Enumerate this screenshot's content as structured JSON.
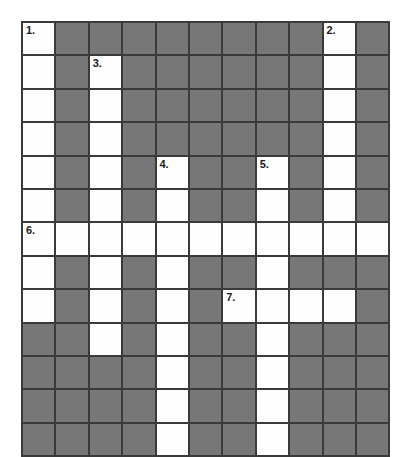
{
  "puzzle": {
    "type": "crossword-grid",
    "rows": 13,
    "cols": 11,
    "cell_size_px": 33.4,
    "colors": {
      "open_cell": "#fdfdfd",
      "block_cell": "#777777",
      "grid_line": "#3a3a3a",
      "number_text": "#1a1a1a",
      "page_background": "#ffffff"
    },
    "legend": {
      "open": "white answer square",
      "block": "shaded blocked square"
    },
    "clue_numbers": [
      {
        "label": "1.",
        "row": 0,
        "col": 0
      },
      {
        "label": "2.",
        "row": 0,
        "col": 9
      },
      {
        "label": "3.",
        "row": 1,
        "col": 2
      },
      {
        "label": "4.",
        "row": 4,
        "col": 4
      },
      {
        "label": "5.",
        "row": 4,
        "col": 7
      },
      {
        "label": "6.",
        "row": 6,
        "col": 0
      },
      {
        "label": "7.",
        "row": 8,
        "col": 6
      }
    ],
    "cells": [
      [
        "open",
        "block",
        "block",
        "block",
        "block",
        "block",
        "block",
        "block",
        "block",
        "open",
        "block"
      ],
      [
        "open",
        "block",
        "open",
        "block",
        "block",
        "block",
        "block",
        "block",
        "block",
        "open",
        "block"
      ],
      [
        "open",
        "block",
        "open",
        "block",
        "block",
        "block",
        "block",
        "block",
        "block",
        "open",
        "block"
      ],
      [
        "open",
        "block",
        "open",
        "block",
        "block",
        "block",
        "block",
        "block",
        "block",
        "open",
        "block"
      ],
      [
        "open",
        "block",
        "open",
        "block",
        "open",
        "block",
        "block",
        "open",
        "block",
        "open",
        "block"
      ],
      [
        "open",
        "block",
        "open",
        "block",
        "open",
        "block",
        "block",
        "open",
        "block",
        "open",
        "block"
      ],
      [
        "open",
        "open",
        "open",
        "open",
        "open",
        "open",
        "open",
        "open",
        "open",
        "open",
        "open"
      ],
      [
        "open",
        "block",
        "open",
        "block",
        "open",
        "block",
        "block",
        "open",
        "block",
        "block",
        "block"
      ],
      [
        "open",
        "block",
        "open",
        "block",
        "open",
        "block",
        "open",
        "open",
        "open",
        "open",
        "block"
      ],
      [
        "block",
        "block",
        "open",
        "block",
        "open",
        "block",
        "block",
        "open",
        "block",
        "block",
        "block"
      ],
      [
        "block",
        "block",
        "block",
        "block",
        "open",
        "block",
        "block",
        "open",
        "block",
        "block",
        "block"
      ],
      [
        "block",
        "block",
        "block",
        "block",
        "open",
        "block",
        "block",
        "open",
        "block",
        "block",
        "block"
      ],
      [
        "block",
        "block",
        "block",
        "block",
        "open",
        "block",
        "block",
        "open",
        "block",
        "block",
        "block"
      ]
    ]
  }
}
